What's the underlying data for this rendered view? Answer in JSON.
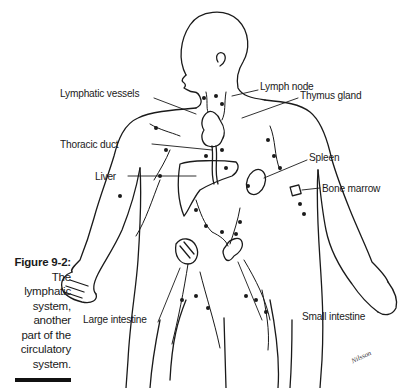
{
  "caption": {
    "figure": "Figure 9-2:",
    "lines": [
      "The",
      "lymphatic",
      "system,",
      "another",
      "part of the",
      "circulatory",
      "system."
    ]
  },
  "labels": {
    "lymph_node": "Lymph node",
    "lymphatic_vessels": "Lymphatic vessels",
    "thymus_gland": "Thymus gland",
    "thoracic_duct": "Thoracic duct",
    "spleen": "Spleen",
    "liver": "Liver",
    "bone_marrow": "Bone marrow",
    "large_intestine": "Large intestine",
    "small_intestine": "Small intestine"
  },
  "signature": "Nilsson",
  "colors": {
    "ink": "#1a1a1a",
    "background": "#ffffff"
  }
}
